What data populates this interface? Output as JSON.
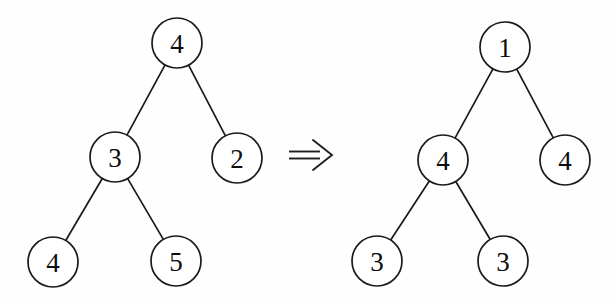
{
  "figure": {
    "background_color": "#fefefe",
    "stroke_color": "#1a1a1a",
    "text_color": "#0d0d0d"
  },
  "left_tree": {
    "name": "source-tree",
    "nodes": [
      {
        "id": "L-root",
        "label": "4",
        "cx": 177,
        "cy": 43,
        "r": 25,
        "role": "root"
      },
      {
        "id": "L-left",
        "label": "3",
        "cx": 115,
        "cy": 157,
        "r": 25,
        "role": "left-child"
      },
      {
        "id": "L-right",
        "label": "2",
        "cx": 237,
        "cy": 158,
        "r": 25,
        "role": "right-child"
      },
      {
        "id": "L-ll",
        "label": "4",
        "cx": 53,
        "cy": 262,
        "r": 25,
        "role": "leaf"
      },
      {
        "id": "L-lr",
        "label": "5",
        "cx": 176,
        "cy": 261,
        "r": 25,
        "role": "leaf"
      }
    ],
    "edges": [
      {
        "from": "L-root",
        "to": "L-left"
      },
      {
        "from": "L-root",
        "to": "L-right"
      },
      {
        "from": "L-left",
        "to": "L-ll"
      },
      {
        "from": "L-left",
        "to": "L-lr"
      }
    ]
  },
  "arrow": {
    "name": "double-right-arrow-icon",
    "glyph": "⟹",
    "x1": 289,
    "x2": 332,
    "cy": 155,
    "gap": 7
  },
  "right_tree": {
    "name": "result-tree",
    "nodes": [
      {
        "id": "R-root",
        "label": "1",
        "cx": 505,
        "cy": 47,
        "r": 25,
        "role": "root"
      },
      {
        "id": "R-left",
        "label": "4",
        "cx": 443,
        "cy": 160,
        "r": 25,
        "role": "left-child"
      },
      {
        "id": "R-right",
        "label": "4",
        "cx": 565,
        "cy": 160,
        "r": 25,
        "role": "right-child"
      },
      {
        "id": "R-ll",
        "label": "3",
        "cx": 377,
        "cy": 261,
        "r": 25,
        "role": "leaf"
      },
      {
        "id": "R-lr",
        "label": "3",
        "cx": 503,
        "cy": 261,
        "r": 25,
        "role": "leaf"
      }
    ],
    "edges": [
      {
        "from": "R-root",
        "to": "R-left"
      },
      {
        "from": "R-root",
        "to": "R-right"
      },
      {
        "from": "R-left",
        "to": "R-ll"
      },
      {
        "from": "R-left",
        "to": "R-lr"
      }
    ]
  }
}
